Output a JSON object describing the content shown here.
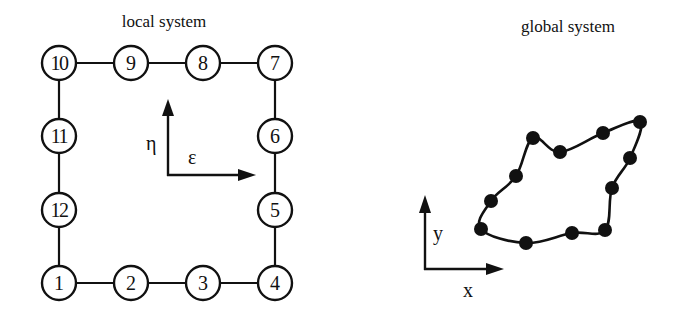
{
  "diagram": {
    "type": "finite-element-mapping",
    "local": {
      "title": "local system",
      "axes": {
        "horizontal_label": "ε",
        "vertical_label": "η"
      },
      "nodes": [
        {
          "id": "1",
          "label": "1",
          "x": 59,
          "y": 283
        },
        {
          "id": "2",
          "label": "2",
          "x": 131,
          "y": 283
        },
        {
          "id": "3",
          "label": "3",
          "x": 203,
          "y": 283
        },
        {
          "id": "4",
          "label": "4",
          "x": 275,
          "y": 283
        },
        {
          "id": "5",
          "label": "5",
          "x": 275,
          "y": 210
        },
        {
          "id": "6",
          "label": "6",
          "x": 275,
          "y": 136
        },
        {
          "id": "7",
          "label": "7",
          "x": 275,
          "y": 63
        },
        {
          "id": "8",
          "label": "8",
          "x": 203,
          "y": 63
        },
        {
          "id": "9",
          "label": "9",
          "x": 131,
          "y": 63
        },
        {
          "id": "10",
          "label": "10",
          "x": 59,
          "y": 63
        },
        {
          "id": "11",
          "label": "11",
          "x": 59,
          "y": 136
        },
        {
          "id": "12",
          "label": "12",
          "x": 59,
          "y": 210
        }
      ],
      "edges": [
        [
          "1",
          "2"
        ],
        [
          "2",
          "3"
        ],
        [
          "3",
          "4"
        ],
        [
          "4",
          "5"
        ],
        [
          "5",
          "6"
        ],
        [
          "6",
          "7"
        ],
        [
          "7",
          "8"
        ],
        [
          "8",
          "9"
        ],
        [
          "9",
          "10"
        ],
        [
          "10",
          "11"
        ],
        [
          "11",
          "12"
        ],
        [
          "12",
          "1"
        ]
      ]
    },
    "global": {
      "title": "global system",
      "axes": {
        "horizontal_label": "x",
        "vertical_label": "y"
      },
      "nodes": [
        {
          "id": "1",
          "x": 481,
          "y": 229
        },
        {
          "id": "2",
          "x": 526,
          "y": 243
        },
        {
          "id": "3",
          "x": 572,
          "y": 233
        },
        {
          "id": "4",
          "x": 605,
          "y": 230
        },
        {
          "id": "5",
          "x": 612,
          "y": 188
        },
        {
          "id": "6",
          "x": 630,
          "y": 158
        },
        {
          "id": "7",
          "x": 640,
          "y": 122
        },
        {
          "id": "8",
          "x": 603,
          "y": 133
        },
        {
          "id": "9",
          "x": 560,
          "y": 152
        },
        {
          "id": "10",
          "x": 533,
          "y": 138
        },
        {
          "id": "11",
          "x": 516,
          "y": 176
        },
        {
          "id": "12",
          "x": 491,
          "y": 201
        }
      ]
    }
  }
}
